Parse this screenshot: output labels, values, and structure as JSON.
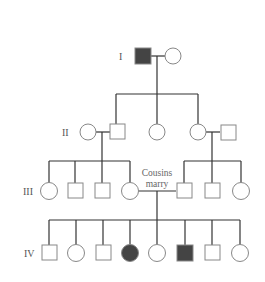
{
  "diagram": {
    "type": "pedigree",
    "colors": {
      "affected": "#444444",
      "unaffected": "#ffffff",
      "outline": "#888888",
      "line": "#333333"
    },
    "generations": [
      {
        "label": "I",
        "y": 56
      },
      {
        "label": "II",
        "y": 132
      },
      {
        "label": "III",
        "y": 191
      },
      {
        "label": "IV",
        "y": 253
      }
    ],
    "annotation": {
      "line1": "Cousins",
      "line2": "marry"
    },
    "individuals": [
      {
        "id": "I-1",
        "gen": 0,
        "sex": "male",
        "affected": true,
        "x": 143
      },
      {
        "id": "I-2",
        "gen": 0,
        "sex": "female",
        "affected": false,
        "x": 173
      },
      {
        "id": "II-1",
        "gen": 1,
        "sex": "female",
        "affected": false,
        "x": 88
      },
      {
        "id": "II-2",
        "gen": 1,
        "sex": "male",
        "affected": false,
        "x": 117
      },
      {
        "id": "II-3",
        "gen": 1,
        "sex": "female",
        "affected": false,
        "x": 157
      },
      {
        "id": "II-4",
        "gen": 1,
        "sex": "female",
        "affected": false,
        "x": 198
      },
      {
        "id": "II-5",
        "gen": 1,
        "sex": "male",
        "affected": false,
        "x": 228
      },
      {
        "id": "III-1",
        "gen": 2,
        "sex": "female",
        "affected": false,
        "x": 49
      },
      {
        "id": "III-2",
        "gen": 2,
        "sex": "male",
        "affected": false,
        "x": 75
      },
      {
        "id": "III-3",
        "gen": 2,
        "sex": "male",
        "affected": false,
        "x": 102
      },
      {
        "id": "III-4",
        "gen": 2,
        "sex": "female",
        "affected": false,
        "x": 130
      },
      {
        "id": "III-5",
        "gen": 2,
        "sex": "male",
        "affected": false,
        "x": 184
      },
      {
        "id": "III-6",
        "gen": 2,
        "sex": "male",
        "affected": false,
        "x": 212
      },
      {
        "id": "III-7",
        "gen": 2,
        "sex": "female",
        "affected": false,
        "x": 241
      },
      {
        "id": "IV-1",
        "gen": 3,
        "sex": "male",
        "affected": false,
        "x": 49
      },
      {
        "id": "IV-2",
        "gen": 3,
        "sex": "female",
        "affected": false,
        "x": 76
      },
      {
        "id": "IV-3",
        "gen": 3,
        "sex": "male",
        "affected": false,
        "x": 103
      },
      {
        "id": "IV-4",
        "gen": 3,
        "sex": "female",
        "affected": true,
        "x": 130
      },
      {
        "id": "IV-5",
        "gen": 3,
        "sex": "female",
        "affected": false,
        "x": 157
      },
      {
        "id": "IV-6",
        "gen": 3,
        "sex": "male",
        "affected": true,
        "x": 185
      },
      {
        "id": "IV-7",
        "gen": 3,
        "sex": "male",
        "affected": false,
        "x": 212
      },
      {
        "id": "IV-8",
        "gen": 3,
        "sex": "female",
        "affected": false,
        "x": 240
      }
    ],
    "matings": [
      {
        "a": "I-1",
        "b": "I-2",
        "consanguineous": false
      },
      {
        "a": "II-1",
        "b": "II-2",
        "consanguineous": false
      },
      {
        "a": "II-4",
        "b": "II-5",
        "consanguineous": false
      },
      {
        "a": "III-4",
        "b": "III-5",
        "consanguineous": true
      }
    ]
  }
}
